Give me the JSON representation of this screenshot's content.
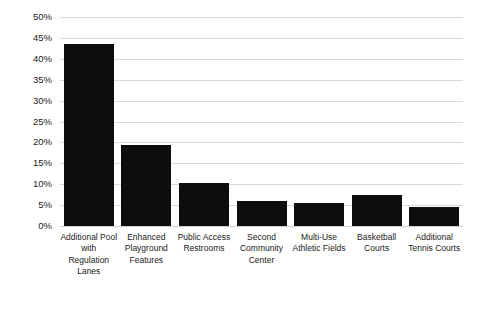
{
  "chart_data": {
    "type": "bar",
    "title": "",
    "subtitle": "",
    "xlabel": "",
    "ylabel": "",
    "categories": [
      "Additional Pool with Regulation Lanes",
      "Enhanced Playground Features",
      "Public Access Restrooms",
      "Second Community Center",
      "Multi-Use Athletic Fields",
      "Basketball Courts",
      "Additional Tennis Courts"
    ],
    "values": [
      43.5,
      19.5,
      10.3,
      6.0,
      5.5,
      7.5,
      4.6
    ],
    "value_labels": [
      "43.5%",
      "19.5%",
      "10.3%",
      "6.0%",
      "5.5%",
      "7.5%",
      "4.6%"
    ],
    "ylim": [
      0,
      50
    ],
    "ytick_values": [
      0,
      5,
      10,
      15,
      20,
      25,
      30,
      35,
      40,
      45,
      50
    ],
    "ytick_labels": [
      "0%",
      "5%",
      "10%",
      "15%",
      "20%",
      "25%",
      "30%",
      "35%",
      "40%",
      "45%",
      "50%"
    ],
    "grid": true,
    "grid_axis": "y",
    "legend": false,
    "legend_position": "none",
    "bar_color": "#0d0d0d",
    "grid_color": "#d9d9d9",
    "background_color": "#ffffff",
    "text_color": "#1a1a1a"
  }
}
